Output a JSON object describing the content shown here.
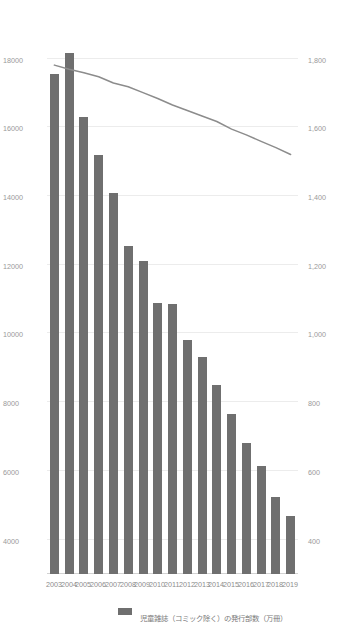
{
  "chart_data": {
    "type": "bar",
    "title": "",
    "subtitle": "",
    "orientation": "horizontal",
    "grid": true,
    "legend_position": "left",
    "categories": [
      "2003",
      "2004",
      "2005",
      "2006",
      "2007",
      "2008",
      "2009",
      "2010",
      "2011",
      "2012",
      "2013",
      "2014",
      "2015",
      "2016",
      "2017",
      "2018",
      "2019"
    ],
    "xlabel": "",
    "ylabel": "",
    "primary_axis": {
      "name": "bar-axis-top",
      "position": "top",
      "label": "児童雑誌（コミック除く）の発行部数（万冊）",
      "ticks": [
        "4000",
        "6000",
        "8000",
        "10000",
        "12000",
        "14000",
        "16000",
        "18000"
      ],
      "tick_values": [
        4000,
        6000,
        8000,
        10000,
        12000,
        14000,
        16000,
        18000
      ],
      "range": [
        3000,
        18600
      ]
    },
    "secondary_axis": {
      "name": "line-axis-bottom",
      "position": "bottom",
      "label": "日本の14歳以下人口（万人）",
      "ticks": [
        "400",
        "600",
        "800",
        "1,000",
        "1,200",
        "1,400",
        "1,600",
        "1,800"
      ],
      "tick_values": [
        400,
        600,
        800,
        1000,
        1200,
        1400,
        1600,
        1800
      ],
      "range": [
        300,
        1860
      ]
    },
    "series": [
      {
        "name": "児童雑誌（コミック除く）の発行部数（万冊）",
        "type": "bar",
        "axis": "primary",
        "color": "#6f6f6f",
        "values": [
          17550,
          18150,
          16300,
          15200,
          14100,
          12550,
          12100,
          10900,
          10850,
          9800,
          9300,
          8500,
          7650,
          6800,
          6150,
          5250,
          4700
        ]
      },
      {
        "name": "日本の14歳以下人口（万人）",
        "type": "line",
        "axis": "secondary",
        "color": "#8c8c8c",
        "values": [
          1781,
          1769,
          1759,
          1747,
          1729,
          1718,
          1701,
          1684,
          1665,
          1649,
          1633,
          1617,
          1595,
          1578,
          1559,
          1541,
          1521
        ]
      }
    ],
    "legend": [
      {
        "label": "児童雑誌（コミック除く）の発行部数（万冊）",
        "marker": "bar-swatch",
        "color": "#6f6f6f"
      },
      {
        "label": "日本の14歳以下人口（万人）",
        "marker": "line-swatch",
        "color": "#8c8c8c"
      }
    ]
  }
}
